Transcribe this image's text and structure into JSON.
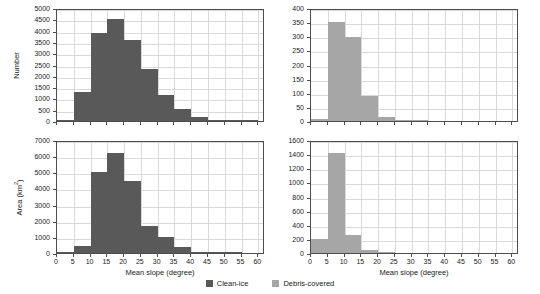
{
  "figure": {
    "panels": [
      "top-left",
      "top-right",
      "bottom-left",
      "bottom-right"
    ],
    "bin_width": 5
  },
  "legend": {
    "items": [
      {
        "label": "Clean-ice",
        "color": "#595959",
        "key": "clean"
      },
      {
        "label": "Debris-covered",
        "color": "#a6a6a6",
        "key": "debris"
      }
    ]
  },
  "chart_data": [
    {
      "id": "top-left",
      "type": "bar",
      "title": "",
      "series_name": "Clean-ice",
      "color": "#595959",
      "xlabel": "",
      "ylabel": "Number",
      "xlim": [
        0,
        62
      ],
      "ylim": [
        0,
        5000
      ],
      "xticks": [
        0,
        5,
        10,
        15,
        20,
        25,
        30,
        35,
        40,
        45,
        50,
        55,
        60
      ],
      "yticks": [
        0,
        500,
        1000,
        1500,
        2000,
        2500,
        3000,
        3500,
        4000,
        4500,
        5000
      ],
      "grid": true,
      "bin_edges": [
        0,
        5,
        10,
        15,
        20,
        25,
        30,
        35,
        40,
        45,
        50,
        55,
        60
      ],
      "categories": [
        "0-5",
        "5-10",
        "10-15",
        "15-20",
        "20-25",
        "25-30",
        "30-35",
        "35-40",
        "40-45",
        "45-50",
        "50-55",
        "55-60"
      ],
      "values": [
        60,
        1290,
        3880,
        4530,
        3600,
        2310,
        1160,
        520,
        190,
        60,
        20,
        10
      ]
    },
    {
      "id": "top-right",
      "type": "bar",
      "title": "",
      "series_name": "Debris-covered",
      "color": "#a6a6a6",
      "xlabel": "",
      "ylabel": "",
      "xlim": [
        0,
        62
      ],
      "ylim": [
        0,
        400
      ],
      "xticks": [
        0,
        5,
        10,
        15,
        20,
        25,
        30,
        35,
        40,
        45,
        50,
        55,
        60
      ],
      "yticks": [
        0,
        50,
        100,
        150,
        200,
        250,
        300,
        350,
        400
      ],
      "grid": true,
      "bin_edges": [
        0,
        5,
        10,
        15,
        20,
        25,
        30,
        35,
        40,
        45,
        50,
        55,
        60
      ],
      "categories": [
        "0-5",
        "5-10",
        "10-15",
        "15-20",
        "20-25",
        "25-30",
        "30-35",
        "35-40",
        "40-45",
        "45-50",
        "50-55",
        "55-60"
      ],
      "values": [
        6,
        350,
        298,
        88,
        15,
        4,
        1,
        0,
        0,
        0,
        0,
        0
      ]
    },
    {
      "id": "bottom-left",
      "type": "bar",
      "title": "",
      "series_name": "Clean-ice",
      "color": "#595959",
      "xlabel": "Mean slope (degree)",
      "ylabel": "Area (km2)",
      "xlim": [
        0,
        62
      ],
      "ylim": [
        0,
        7000
      ],
      "xticks": [
        0,
        5,
        10,
        15,
        20,
        25,
        30,
        35,
        40,
        45,
        50,
        55,
        60
      ],
      "yticks": [
        0,
        1000,
        2000,
        3000,
        4000,
        5000,
        6000,
        7000
      ],
      "grid": true,
      "bin_edges": [
        0,
        5,
        10,
        15,
        20,
        25,
        30,
        35,
        40,
        45,
        50,
        55,
        60
      ],
      "categories": [
        "0-5",
        "5-10",
        "10-15",
        "15-20",
        "20-25",
        "25-30",
        "30-35",
        "35-40",
        "40-45",
        "45-50",
        "50-55",
        "55-60"
      ],
      "values": [
        20,
        440,
        5000,
        6200,
        4450,
        1650,
        1000,
        400,
        90,
        20,
        5,
        0
      ]
    },
    {
      "id": "bottom-right",
      "type": "bar",
      "title": "",
      "series_name": "Debris-covered",
      "color": "#a6a6a6",
      "xlabel": "Mean slope (degree)",
      "ylabel": "",
      "xlim": [
        0,
        62
      ],
      "ylim": [
        0,
        1600
      ],
      "xticks": [
        0,
        5,
        10,
        15,
        20,
        25,
        30,
        35,
        40,
        45,
        50,
        55,
        60
      ],
      "yticks": [
        0,
        200,
        400,
        600,
        800,
        1000,
        1200,
        1400,
        1600
      ],
      "grid": true,
      "bin_edges": [
        0,
        5,
        10,
        15,
        20,
        25,
        30,
        35,
        40,
        45,
        50,
        55,
        60
      ],
      "categories": [
        "0-5",
        "5-10",
        "10-15",
        "15-20",
        "20-25",
        "25-30",
        "30-35",
        "35-40",
        "40-45",
        "45-50",
        "50-55",
        "55-60"
      ],
      "values": [
        200,
        1415,
        250,
        45,
        3,
        0,
        0,
        0,
        0,
        0,
        0,
        0
      ]
    }
  ]
}
